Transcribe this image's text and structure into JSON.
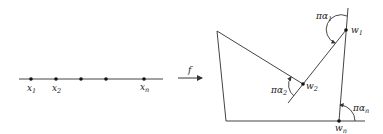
{
  "diagram": {
    "type": "conformal-map-schematic",
    "colors": {
      "stroke": "#444444",
      "text": "#222222",
      "background": "#ffffff"
    },
    "domain": {
      "line": {
        "x1": 19,
        "x2": 163,
        "y": 79
      },
      "points": [
        {
          "x": 31,
          "label": "x",
          "sub": "1"
        },
        {
          "x": 56,
          "label": "x",
          "sub": "2"
        },
        {
          "x": 81,
          "label": "",
          "sub": ""
        },
        {
          "x": 106,
          "label": "",
          "sub": ""
        },
        {
          "x": 144,
          "label": "x",
          "sub": "n"
        }
      ]
    },
    "map_arrow": {
      "label": "f",
      "x1": 178,
      "x2": 203,
      "y": 78
    },
    "polygon": {
      "vertices": [
        {
          "name": "top-left",
          "x": 217,
          "y": 31
        },
        {
          "name": "w2",
          "x": 303,
          "y": 84
        },
        {
          "name": "w1",
          "x": 346,
          "y": 30
        },
        {
          "name": "wn",
          "x": 339,
          "y": 121
        },
        {
          "name": "bottom-left",
          "x": 226,
          "y": 121
        }
      ],
      "labels": {
        "w1": {
          "text": "w",
          "sub": "1"
        },
        "w2": {
          "text": "w",
          "sub": "2"
        },
        "wn": {
          "text": "w",
          "sub": "n"
        }
      },
      "angles": {
        "a1": {
          "text": "πα",
          "sub": "1"
        },
        "a2": {
          "text": "πα",
          "sub": "2"
        },
        "an": {
          "text": "πα",
          "sub": "n"
        }
      }
    }
  }
}
